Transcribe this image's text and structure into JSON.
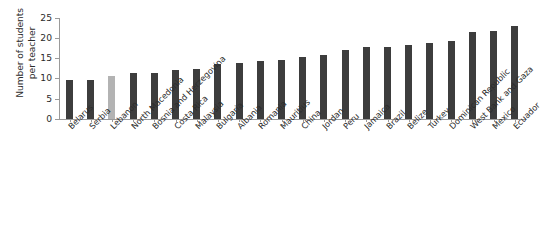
{
  "chart_data": {
    "type": "bar",
    "title": "",
    "subtitle": "",
    "xlabel": "",
    "ylabel": "Number of students\nper teacher",
    "ylim": [
      0,
      25
    ],
    "yticks": [
      0,
      5,
      10,
      15,
      20,
      25
    ],
    "ytick_labels": [
      "0",
      "5",
      "10",
      "15",
      "20",
      "25"
    ],
    "grid": false,
    "legend": "none",
    "bar_color": "#3d3d3d",
    "highlight_color": "#b3b3b3",
    "highlight_category": "Lebanon",
    "axis_color": "#9a9a9a",
    "categories": [
      "Belarus",
      "Serbia",
      "Lebanon",
      "North Macedonia",
      "Bosnia and Herzegovina",
      "Costa Rica",
      "Malaysia",
      "Bulgaria",
      "Albania",
      "Romania",
      "Mauritius",
      "China",
      "Jordan",
      "Peru",
      "Jamaica",
      "Brazil",
      "Belize",
      "Turkey",
      "Dominican Republic",
      "West Bank and Gaza",
      "Mexico",
      "Ecuador"
    ],
    "values": [
      9.7,
      9.7,
      10.7,
      11.5,
      11.4,
      12.2,
      12.3,
      13.7,
      14.0,
      14.4,
      14.7,
      15.5,
      16.0,
      17.2,
      17.9,
      18.0,
      18.3,
      18.8,
      19.4,
      21.5,
      21.8,
      23.0
    ]
  }
}
